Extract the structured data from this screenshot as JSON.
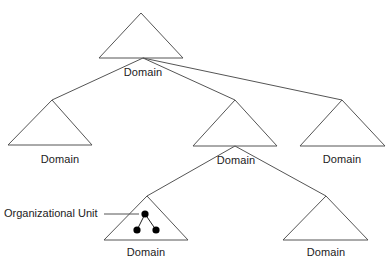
{
  "diagram": {
    "type": "domain-tree",
    "colors": {
      "line": "#555555",
      "text": "#222222",
      "node": "#000000",
      "background": "#ffffff"
    },
    "nodes": [
      {
        "id": "root",
        "label": "Domain",
        "apex": [
          141,
          13
        ],
        "base": [
          [
            99,
            58
          ],
          [
            183,
            58
          ]
        ],
        "label_pos": [
          143,
          68
        ]
      },
      {
        "id": "child-left",
        "label": "Domain",
        "apex": [
          52,
          100
        ],
        "base": [
          [
            8,
            145
          ],
          [
            92,
            145
          ]
        ],
        "label_pos": [
          60,
          155
        ]
      },
      {
        "id": "child-middle",
        "label": "Domain",
        "apex": [
          235,
          100
        ],
        "base": [
          [
            193,
            146
          ],
          [
            277,
            146
          ]
        ],
        "label_pos": [
          236,
          155
        ]
      },
      {
        "id": "child-right",
        "label": "Domain",
        "apex": [
          342,
          100
        ],
        "base": [
          [
            300,
            146
          ],
          [
            385,
            146
          ]
        ],
        "label_pos": [
          342,
          155
        ]
      },
      {
        "id": "grandchild-left",
        "label": "Domain",
        "apex": [
          147,
          196
        ],
        "base": [
          [
            104,
            240
          ],
          [
            188,
            240
          ]
        ],
        "label_pos": [
          146,
          248
        ]
      },
      {
        "id": "grandchild-right",
        "label": "Domain",
        "apex": [
          326,
          196
        ],
        "base": [
          [
            283,
            240
          ],
          [
            368,
            240
          ]
        ],
        "label_pos": [
          326,
          248
        ]
      }
    ],
    "edges": [
      {
        "from": "root",
        "to": "child-left"
      },
      {
        "from": "root",
        "to": "child-middle"
      },
      {
        "from": "root",
        "to": "child-right"
      },
      {
        "from": "child-middle",
        "to": "grandchild-left"
      },
      {
        "from": "child-middle",
        "to": "grandchild-right"
      }
    ],
    "organizational_unit": {
      "label": "Organizational Unit",
      "in_node": "grandchild-left",
      "dots": [
        [
          145,
          214
        ],
        [
          137,
          230
        ],
        [
          156,
          230
        ]
      ]
    }
  }
}
